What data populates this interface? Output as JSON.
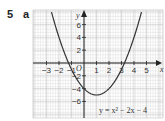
{
  "question": {
    "number": "5",
    "part": "a"
  },
  "chart_data": {
    "type": "line",
    "title": "",
    "xlabel": "x",
    "ylabel": "y",
    "origin_label": "O",
    "xlim": [
      -3.8,
      5.6
    ],
    "ylim": [
      -7.5,
      9
    ],
    "x_ticks": [
      -3,
      -2,
      -1,
      1,
      2,
      3,
      4,
      5
    ],
    "x_tick_labels": [
      "−3",
      "−2",
      "−1",
      "1",
      "2",
      "3",
      "4",
      "5"
    ],
    "y_ticks": [
      -6,
      -4,
      -2,
      2,
      4,
      6
    ],
    "y_tick_labels": [
      "−6",
      "−4",
      "−2",
      "2",
      "4",
      "6"
    ],
    "grid": true,
    "series": [
      {
        "name": "y = x² − 2x − 4",
        "equation": "y = x^2 - 2x - 4",
        "x": [
          -2.5,
          -2,
          -1.5,
          -1.24,
          -1,
          -0.5,
          0,
          0.5,
          1,
          1.5,
          2,
          2.5,
          3,
          3.24,
          3.5,
          4,
          4.5
        ],
        "y": [
          7.25,
          4,
          1.25,
          0,
          -1,
          -2.75,
          -4,
          -4.75,
          -5,
          -4.75,
          -4,
          -2.75,
          -1,
          0,
          1.25,
          4,
          7.25
        ]
      }
    ],
    "annotations": [
      {
        "text": "y = x² − 2x − 4",
        "position": "bottom-right"
      }
    ]
  },
  "labels": {
    "equation": "y = x² − 2x − 4"
  }
}
